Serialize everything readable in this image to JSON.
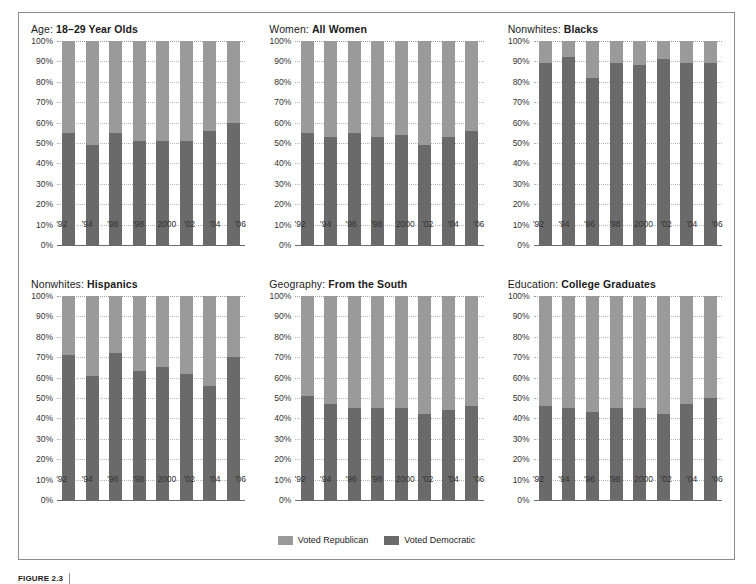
{
  "figure": {
    "caption_number": "FIGURE 2.3",
    "caption_text": ""
  },
  "legend": {
    "position": "bottom-center",
    "items": [
      {
        "label": "Voted Republican",
        "color": "#9a9a9a",
        "key": "republican"
      },
      {
        "label": "Voted Democratic",
        "color": "#6a6a6a",
        "key": "democratic"
      }
    ]
  },
  "axis": {
    "y_ticks": [
      "100%",
      "90%",
      "80%",
      "70%",
      "60%",
      "50%",
      "40%",
      "30%",
      "20%",
      "10%",
      "0%"
    ],
    "y_values": [
      100,
      90,
      80,
      70,
      60,
      50,
      40,
      30,
      20,
      10,
      0
    ],
    "x_ticks": [
      "'92",
      "'94",
      "'96",
      "'98",
      "2000",
      "'02",
      "'04",
      "'06"
    ],
    "ylim": [
      0,
      100
    ],
    "grid": true
  },
  "chart_data": [
    {
      "type": "bar",
      "stacked": true,
      "title": "Age: 18–29 Year Olds",
      "category_label": "Age:",
      "group_label": "18–29 Year Olds",
      "xlabel": "",
      "ylabel": "",
      "ylim": [
        0,
        100
      ],
      "grid": true,
      "categories": [
        "'92",
        "'94",
        "'96",
        "'98",
        "2000",
        "'02",
        "'04",
        "'06"
      ],
      "series": [
        {
          "name": "Voted Democratic",
          "values": [
            55,
            49,
            55,
            51,
            51,
            51,
            56,
            60
          ]
        },
        {
          "name": "Voted Republican",
          "values": [
            45,
            51,
            45,
            49,
            49,
            49,
            44,
            40
          ]
        }
      ]
    },
    {
      "type": "bar",
      "stacked": true,
      "title": "Women: All Women",
      "category_label": "Women:",
      "group_label": "All Women",
      "xlabel": "",
      "ylabel": "",
      "ylim": [
        0,
        100
      ],
      "grid": true,
      "categories": [
        "'92",
        "'94",
        "'96",
        "'98",
        "2000",
        "'02",
        "'04",
        "'06"
      ],
      "series": [
        {
          "name": "Voted Democratic",
          "values": [
            55,
            53,
            55,
            53,
            54,
            49,
            53,
            56
          ]
        },
        {
          "name": "Voted Republican",
          "values": [
            45,
            47,
            45,
            47,
            46,
            51,
            47,
            44
          ]
        }
      ]
    },
    {
      "type": "bar",
      "stacked": true,
      "title": "Nonwhites: Blacks",
      "category_label": "Nonwhites:",
      "group_label": "Blacks",
      "xlabel": "",
      "ylabel": "",
      "ylim": [
        0,
        100
      ],
      "grid": true,
      "categories": [
        "'92",
        "'94",
        "'96",
        "'98",
        "2000",
        "'02",
        "'04",
        "'06"
      ],
      "series": [
        {
          "name": "Voted Democratic",
          "values": [
            89,
            92,
            82,
            89,
            88,
            91,
            89,
            89
          ]
        },
        {
          "name": "Voted Republican",
          "values": [
            11,
            8,
            18,
            11,
            12,
            9,
            11,
            11
          ]
        }
      ]
    },
    {
      "type": "bar",
      "stacked": true,
      "title": "Nonwhites: Hispanics",
      "category_label": "Nonwhites:",
      "group_label": "Hispanics",
      "xlabel": "",
      "ylabel": "",
      "ylim": [
        0,
        100
      ],
      "grid": true,
      "categories": [
        "'92",
        "'94",
        "'96",
        "'98",
        "2000",
        "'02",
        "'04",
        "'06"
      ],
      "series": [
        {
          "name": "Voted Democratic",
          "values": [
            71,
            61,
            72,
            63,
            65,
            62,
            56,
            70
          ]
        },
        {
          "name": "Voted Republican",
          "values": [
            29,
            39,
            28,
            37,
            35,
            38,
            44,
            30
          ]
        }
      ]
    },
    {
      "type": "bar",
      "stacked": true,
      "title": "Geography: From the South",
      "category_label": "Geography:",
      "group_label": "From the South",
      "xlabel": "",
      "ylabel": "",
      "ylim": [
        0,
        100
      ],
      "grid": true,
      "categories": [
        "'92",
        "'94",
        "'96",
        "'98",
        "2000",
        "'02",
        "'04",
        "'06"
      ],
      "series": [
        {
          "name": "Voted Democratic",
          "values": [
            51,
            47,
            45,
            45,
            45,
            42,
            44,
            46
          ]
        },
        {
          "name": "Voted Republican",
          "values": [
            49,
            53,
            55,
            55,
            55,
            58,
            56,
            54
          ]
        }
      ]
    },
    {
      "type": "bar",
      "stacked": true,
      "title": "Education: College Graduates",
      "category_label": "Education:",
      "group_label": "College Graduates",
      "xlabel": "",
      "ylabel": "",
      "ylim": [
        0,
        100
      ],
      "grid": true,
      "categories": [
        "'92",
        "'94",
        "'96",
        "'98",
        "2000",
        "'02",
        "'04",
        "'06"
      ],
      "series": [
        {
          "name": "Voted Democratic",
          "values": [
            46,
            45,
            43,
            45,
            45,
            42,
            47,
            50
          ]
        },
        {
          "name": "Voted Republican",
          "values": [
            54,
            55,
            57,
            55,
            55,
            58,
            53,
            50
          ]
        }
      ]
    }
  ]
}
